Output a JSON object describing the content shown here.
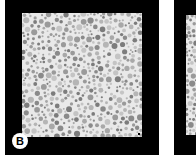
{
  "figure": {
    "panels": [
      {
        "id": "B",
        "label": "B",
        "content": "grayscale circle-packing pattern (pseudoisochromatic plate style)",
        "frame_color": "#000000",
        "background_color": "#e9e9e9",
        "dot_colors": [
          "#8a8a8a",
          "#9a9a9a",
          "#a8a8a8",
          "#b5b5b5",
          "#c4c4c4",
          "#7c7c7c"
        ]
      },
      {
        "id": "C",
        "label": "",
        "content": "partially visible adjacent panel with same dot pattern",
        "frame_color": "#000000",
        "background_color": "#e9e9e9"
      }
    ]
  }
}
